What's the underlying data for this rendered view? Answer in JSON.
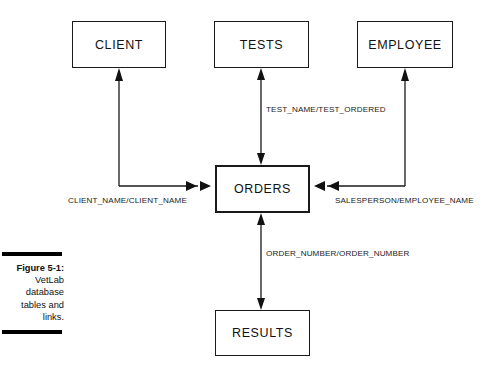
{
  "figure": {
    "number_label": "Figure 5-1:",
    "caption_lines": [
      "VetLab",
      "database",
      "tables and",
      "links."
    ],
    "full_caption": "Figure 5-1: VetLab database tables and links."
  },
  "diagram": {
    "entities": [
      {
        "id": "client",
        "label": "CLIENT",
        "x": 72,
        "y": 21,
        "width": 94,
        "height": 47,
        "emphasis": "normal"
      },
      {
        "id": "tests",
        "label": "TESTS",
        "x": 214,
        "y": 21,
        "width": 95,
        "height": 47,
        "emphasis": "normal"
      },
      {
        "id": "employee",
        "label": "EMPLOYEE",
        "x": 357,
        "y": 21,
        "width": 96,
        "height": 47,
        "emphasis": "normal"
      },
      {
        "id": "orders",
        "label": "ORDERS",
        "x": 215,
        "y": 165,
        "width": 95,
        "height": 48,
        "emphasis": "central"
      },
      {
        "id": "results",
        "label": "RESULTS",
        "x": 215,
        "y": 310,
        "width": 95,
        "height": 46,
        "emphasis": "normal"
      }
    ],
    "links": [
      {
        "id": "client-orders",
        "from": "CLIENT",
        "to": "ORDERS",
        "label": "CLIENT_NAME/CLIENT_NAME",
        "shape": "elbow",
        "arrowheads": "both"
      },
      {
        "id": "tests-orders",
        "from": "TESTS",
        "to": "ORDERS",
        "label": "TEST_NAME/TEST_ORDERED",
        "shape": "vertical",
        "arrowheads": "both"
      },
      {
        "id": "employee-orders",
        "from": "EMPLOYEE",
        "to": "ORDERS",
        "label": "SALESPERSON/EMPLOYEE_NAME",
        "shape": "elbow",
        "arrowheads": "both"
      },
      {
        "id": "orders-results",
        "from": "ORDERS",
        "to": "RESULTS",
        "label": "ORDER_NUMBER/ORDER_NUMBER",
        "shape": "vertical",
        "arrowheads": "both"
      }
    ]
  },
  "colors": {
    "line": "#1a1a1a",
    "background": "#ffffff",
    "caption_bar": "#000000",
    "text": "#121212"
  }
}
